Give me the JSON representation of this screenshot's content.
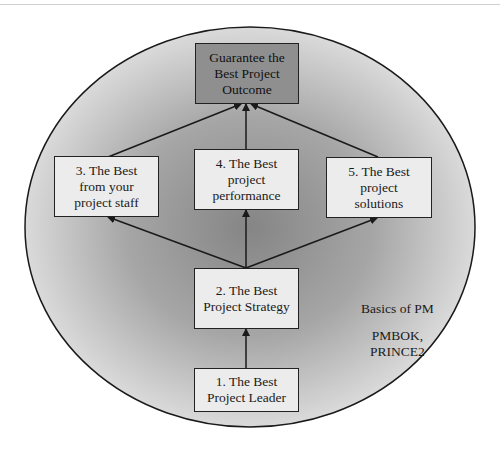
{
  "diagram": {
    "outcome": {
      "lines": [
        "Guarantee the",
        "Best Project",
        "Outcome"
      ]
    },
    "box3": {
      "lines": [
        "3. The Best",
        "from your",
        "project staff"
      ]
    },
    "box4": {
      "lines": [
        "4. The Best",
        "project",
        "performance"
      ]
    },
    "box5": {
      "lines": [
        "5. The Best",
        "project",
        "solutions"
      ]
    },
    "box2": {
      "lines": [
        "2. The Best",
        "Project Strategy"
      ]
    },
    "box1": {
      "lines": [
        "1. The Best",
        "Project Leader"
      ]
    },
    "notes": {
      "basics": "Basics of PM",
      "standards_line1": "PMBOK,",
      "standards_line2": "PRINCE2"
    },
    "colors": {
      "ellipse_outer": "#d8d8d8",
      "ellipse_center": "#8a8a8a",
      "outcome_fill": "#8f8f8f",
      "box_fill": "#ececec",
      "stroke": "#222222"
    }
  }
}
